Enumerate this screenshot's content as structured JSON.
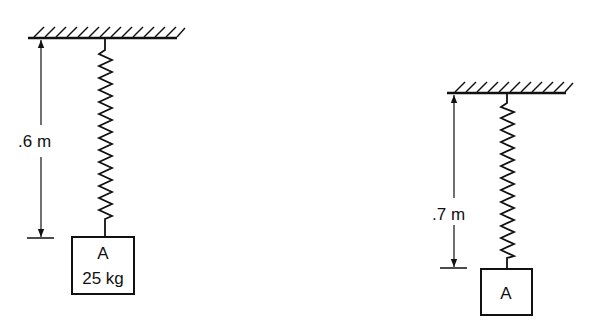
{
  "diagram": {
    "left": {
      "distance_label": ".6 m",
      "block_label": "A",
      "block_mass_label": "25 kg"
    },
    "right": {
      "distance_label": ".7 m",
      "block_label": "A"
    }
  },
  "colors": {
    "stroke": "#111111",
    "background": "#ffffff"
  }
}
